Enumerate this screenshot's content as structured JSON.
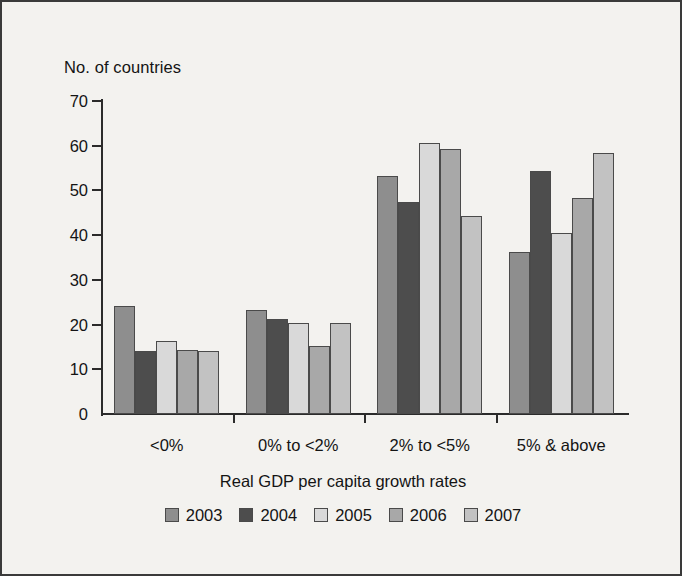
{
  "chart_data": {
    "type": "bar",
    "title": "",
    "ylabel": "No. of countries",
    "xlabel": "Real GDP per capita growth rates",
    "ylim": [
      0,
      70
    ],
    "ytick_step": 10,
    "yticks": [
      "0",
      "10",
      "20",
      "30",
      "40",
      "50",
      "60",
      "70"
    ],
    "grid": false,
    "legend_position": "bottom",
    "categories": [
      "<0%",
      "0% to <2%",
      "2% to <5%",
      "5% & above"
    ],
    "series": [
      {
        "name": "2003",
        "color": "#8e8e8e",
        "values": [
          24.2,
          23.2,
          53.2,
          36.3
        ]
      },
      {
        "name": "2004",
        "color": "#4d4d4d",
        "values": [
          14.2,
          21.2,
          47.4,
          54.3
        ]
      },
      {
        "name": "2005",
        "color": "#d9d9d9",
        "values": [
          16.3,
          20.3,
          60.5,
          40.4
        ]
      },
      {
        "name": "2006",
        "color": "#a8a8a8",
        "values": [
          14.3,
          15.2,
          59.2,
          48.4
        ]
      },
      {
        "name": "2007",
        "color": "#c2c2c2",
        "values": [
          14.2,
          20.3,
          44.2,
          58.3
        ]
      }
    ]
  },
  "colors": {
    "background": "#f3f2ef",
    "axis": "#2b2b2b",
    "text": "#141414",
    "bar_border": "#4a4a4a"
  }
}
